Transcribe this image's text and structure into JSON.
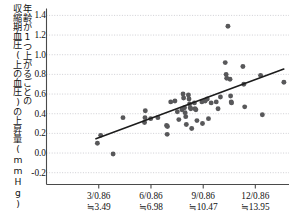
{
  "chart_data": {
    "type": "scatter",
    "title": "",
    "xlabel": "",
    "ylabel": "年齢が1つ上がるごとの収縮期血圧(上の血圧)の上昇量(mmHg)",
    "ylabel_columns": [
      "年齢が1つ上がるごとの",
      "収縮期血圧(上の血圧)の上昇量(mmHg)"
    ],
    "xlim": [
      0.0,
      16.2
    ],
    "ylim": [
      -0.32,
      1.46
    ],
    "grid": true,
    "grid_style": "dotted",
    "xticks": [
      3.49,
      6.98,
      10.47,
      13.95
    ],
    "xtick_labels": [
      {
        "line1": "3/0.86",
        "line2": "≒3.49"
      },
      {
        "line1": "6/0.86",
        "line2": "≒6.98"
      },
      {
        "line1": "9/0.86",
        "line2": "≒10.47"
      },
      {
        "line1": "12/0.86",
        "line2": "≒13.95"
      }
    ],
    "yticks": [
      -0.2,
      0.0,
      0.2,
      0.4,
      0.6,
      0.8,
      1.0,
      1.2,
      1.4
    ],
    "ytick_labels": [
      "-0.2",
      "0.0",
      "0.2",
      "0.4",
      "0.6",
      "0.8",
      "1.0",
      "1.2",
      "1.4"
    ],
    "marker_color": "#58585a",
    "line_color": "#1c1c1c",
    "axis_color": "#4a4a4a",
    "grid_color": "#c9c9cf",
    "series": [
      {
        "name": "観測値",
        "marker": "circle",
        "points": [
          [
            3.4,
            0.1
          ],
          [
            3.62,
            0.18
          ],
          [
            4.45,
            -0.01
          ],
          [
            5.11,
            0.36
          ],
          [
            6.6,
            0.43
          ],
          [
            6.58,
            0.36
          ],
          [
            6.55,
            0.31
          ],
          [
            6.96,
            0.35
          ],
          [
            7.44,
            0.36
          ],
          [
            8.02,
            0.28
          ],
          [
            8.08,
            0.27
          ],
          [
            8.06,
            0.19
          ],
          [
            8.3,
            0.52
          ],
          [
            8.58,
            0.53
          ],
          [
            8.74,
            0.42
          ],
          [
            8.84,
            0.34
          ],
          [
            9.05,
            0.44
          ],
          [
            9.12,
            0.6
          ],
          [
            9.16,
            0.56
          ],
          [
            9.22,
            0.46
          ],
          [
            9.26,
            0.41
          ],
          [
            9.3,
            0.37
          ],
          [
            9.34,
            0.29
          ],
          [
            9.48,
            0.59
          ],
          [
            9.52,
            0.55
          ],
          [
            9.56,
            0.5
          ],
          [
            9.6,
            0.46
          ],
          [
            9.64,
            0.45
          ],
          [
            9.7,
            0.25
          ],
          [
            9.88,
            0.51
          ],
          [
            9.92,
            0.45
          ],
          [
            9.98,
            0.44
          ],
          [
            10.05,
            0.33
          ],
          [
            10.38,
            0.52
          ],
          [
            10.42,
            0.3
          ],
          [
            10.6,
            0.53
          ],
          [
            10.74,
            0.55
          ],
          [
            10.82,
            0.35
          ],
          [
            11.0,
            0.51
          ],
          [
            11.34,
            0.52
          ],
          [
            11.46,
            0.45
          ],
          [
            11.62,
            0.57
          ],
          [
            11.94,
            0.92
          ],
          [
            12.0,
            0.8
          ],
          [
            12.04,
            0.76
          ],
          [
            12.12,
            1.29
          ],
          [
            12.26,
            0.75
          ],
          [
            12.3,
            0.58
          ],
          [
            12.34,
            0.52
          ],
          [
            12.36,
            0.51
          ],
          [
            13.12,
            0.88
          ],
          [
            13.18,
            0.7
          ],
          [
            13.24,
            0.47
          ],
          [
            14.3,
            0.79
          ],
          [
            14.42,
            0.39
          ],
          [
            15.86,
            0.72
          ]
        ]
      }
    ],
    "trend_line": {
      "name": "回帰直線",
      "x_start": 3.3,
      "y_start": 0.145,
      "x_end": 15.85,
      "y_end": 0.855
    }
  }
}
